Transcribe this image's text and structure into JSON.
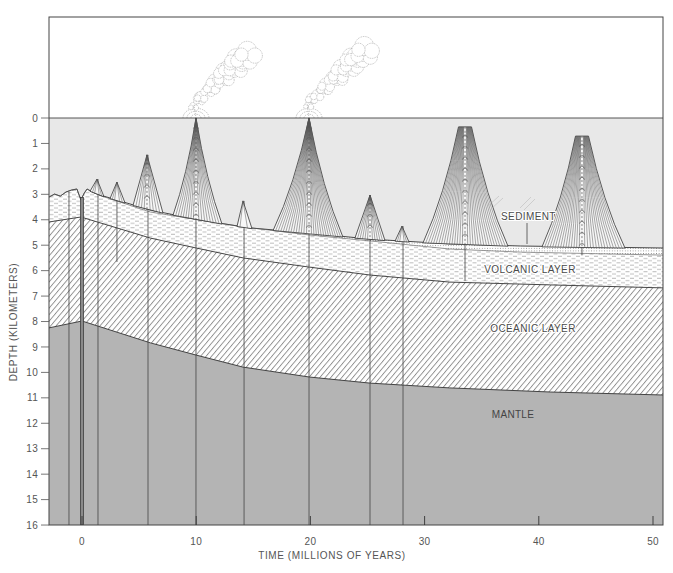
{
  "diagram": {
    "y_axis": {
      "label": "DEPTH (KILOMETERS)",
      "range_km": [
        0,
        16
      ],
      "ticks": [
        0,
        1,
        2,
        3,
        4,
        5,
        6,
        7,
        8,
        9,
        10,
        11,
        12,
        13,
        14,
        15,
        16
      ]
    },
    "x_axis": {
      "label": "TIME (MILLIONS OF YEARS)",
      "range_ma": [
        -2.9,
        50.9
      ],
      "ticks": [
        0,
        10,
        20,
        30,
        40,
        50
      ]
    },
    "labels": {
      "sediment": "SEDIMENT",
      "volcanic_layer": "VOLCANIC LAYER",
      "oceanic_layer": "OCEANIC LAYER",
      "mantle": "MANTLE"
    },
    "sea_level_km": 0,
    "ridge_axis_ma": 0,
    "profiles": {
      "seafloor_surface": [
        [
          -2.9,
          3.11
        ],
        [
          -2.4,
          2.99
        ],
        [
          -1.9,
          3.07
        ],
        [
          -1.4,
          2.91
        ],
        [
          -0.9,
          2.83
        ],
        [
          -0.45,
          2.79
        ],
        [
          -0.1,
          3.22
        ],
        [
          0.2,
          2.95
        ],
        [
          0.45,
          2.79
        ],
        [
          0.9,
          2.91
        ],
        [
          1.6,
          3.03
        ],
        [
          6.0,
          3.62
        ],
        [
          10.3,
          4.01
        ],
        [
          14.7,
          4.32
        ],
        [
          19.9,
          4.52
        ],
        [
          25.2,
          4.76
        ],
        [
          32.2,
          4.95
        ],
        [
          38.4,
          5.03
        ],
        [
          50.9,
          5.11
        ]
      ],
      "volcanic_top": [
        [
          -2.9,
          3.11
        ],
        [
          -2.4,
          2.99
        ],
        [
          -1.9,
          3.07
        ],
        [
          -1.4,
          2.91
        ],
        [
          -0.9,
          2.83
        ],
        [
          -0.45,
          2.79
        ],
        [
          -0.1,
          3.22
        ],
        [
          0.2,
          2.95
        ],
        [
          0.45,
          2.79
        ],
        [
          0.9,
          2.91
        ],
        [
          1.6,
          3.05
        ],
        [
          6.0,
          3.7
        ],
        [
          14.1,
          4.28
        ],
        [
          19.9,
          4.6
        ],
        [
          25.2,
          4.83
        ],
        [
          32.2,
          5.15
        ],
        [
          38.4,
          5.27
        ],
        [
          50.9,
          5.39
        ]
      ],
      "oceanic_top": [
        [
          -2.9,
          4.09
        ],
        [
          -0.1,
          3.89
        ],
        [
          6.0,
          4.72
        ],
        [
          10.0,
          5.11
        ],
        [
          14.1,
          5.5
        ],
        [
          19.9,
          5.86
        ],
        [
          25.2,
          6.17
        ],
        [
          32.2,
          6.45
        ],
        [
          41.0,
          6.56
        ],
        [
          50.9,
          6.68
        ]
      ],
      "mantle_top": [
        [
          -2.9,
          8.25
        ],
        [
          0.0,
          7.98
        ],
        [
          6.0,
          8.84
        ],
        [
          10.0,
          9.32
        ],
        [
          14.1,
          9.79
        ],
        [
          19.9,
          10.18
        ],
        [
          25.2,
          10.42
        ],
        [
          32.2,
          10.61
        ],
        [
          41.0,
          10.77
        ],
        [
          50.9,
          10.89
        ]
      ]
    },
    "seamounts": [
      {
        "center_ma": 1.31,
        "peak_km": 2.4,
        "base_ma": [
          0.7,
          1.93
        ],
        "top_width_ma": 0,
        "shape": "straight",
        "active": false
      },
      {
        "center_ma": 3.06,
        "peak_km": 2.52,
        "base_ma": [
          2.45,
          3.77
        ],
        "top_width_ma": 0,
        "shape": "straight",
        "active": false
      },
      {
        "center_ma": 5.69,
        "peak_km": 1.45,
        "base_ma": [
          4.47,
          7.09
        ],
        "top_width_ma": 0,
        "shape": "straight",
        "active": false
      },
      {
        "center_ma": 9.98,
        "peak_km": 0.0,
        "base_ma": [
          7.97,
          12.26
        ],
        "top_width_ma": 0,
        "shape": "concave",
        "active": true
      },
      {
        "center_ma": 14.1,
        "peak_km": 3.26,
        "base_ma": [
          13.57,
          14.89
        ],
        "top_width_ma": 0,
        "shape": "straight",
        "active": false
      },
      {
        "center_ma": 19.88,
        "peak_km": 0.0,
        "base_ma": [
          16.73,
          22.85
        ],
        "top_width_ma": 0,
        "shape": "concave",
        "active": true
      },
      {
        "center_ma": 25.22,
        "peak_km": 3.03,
        "base_ma": [
          23.9,
          26.53
        ],
        "top_width_ma": 0,
        "shape": "straight",
        "active": false
      },
      {
        "center_ma": 28.02,
        "peak_km": 4.25,
        "base_ma": [
          27.41,
          28.63
        ],
        "top_width_ma": 0,
        "shape": "straight",
        "active": false
      },
      {
        "center_ma": 33.54,
        "peak_km": 0.35,
        "base_ma": [
          29.86,
          37.3
        ],
        "top_width_ma": 1.14,
        "shape": "concave",
        "active": false
      },
      {
        "center_ma": 43.78,
        "peak_km": 0.71,
        "base_ma": [
          40.28,
          47.55
        ],
        "top_width_ma": 1.14,
        "shape": "concave",
        "active": false
      }
    ],
    "feeder_dikes": [
      {
        "time_ma": -1.14,
        "top_km": 2.9,
        "bottom_km": 16
      },
      {
        "time_ma": 1.4,
        "top_km": 2.4,
        "bottom_km": 16
      },
      {
        "time_ma": 3.06,
        "top_km": 2.52,
        "bottom_km": 5.66
      },
      {
        "time_ma": 5.78,
        "top_km": 1.45,
        "bottom_km": 16
      },
      {
        "time_ma": 9.98,
        "top_km": 0.0,
        "bottom_km": 16
      },
      {
        "time_ma": 14.19,
        "top_km": 3.26,
        "bottom_km": 16
      },
      {
        "time_ma": 19.88,
        "top_km": 0.0,
        "bottom_km": 16
      },
      {
        "time_ma": 25.22,
        "top_km": 3.03,
        "bottom_km": 16
      },
      {
        "time_ma": 28.11,
        "top_km": 4.25,
        "bottom_km": 16
      },
      {
        "time_ma": 33.54,
        "top_km": 0.35,
        "bottom_km": 6.4
      },
      {
        "time_ma": 43.78,
        "top_km": 0.71,
        "bottom_km": 5.4
      }
    ],
    "eruption_plumes": [
      {
        "vent_ma": 9.98
      },
      {
        "vent_ma": 19.88
      }
    ],
    "colors": {
      "water": "#e8e8e8",
      "mantle": "#b4b4b4",
      "seamount_fill": "#f7f7f7",
      "line": "#333333",
      "text": "#555555",
      "plume_stroke": "#9a9a9a"
    }
  }
}
